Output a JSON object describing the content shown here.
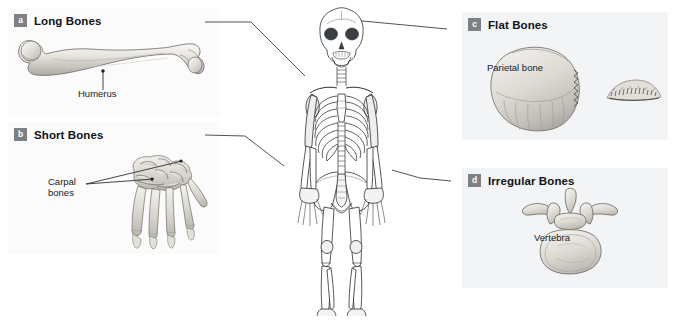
{
  "figure": {
    "background": "#ffffff",
    "badge_color": "#7e8183",
    "badge_text_color": "#ffffff",
    "panel_tint_left": "#fbfbfb",
    "panel_tint_right": "#f2f4f6"
  },
  "panels": [
    {
      "key": "a",
      "badge": "a",
      "title": "Long Bones",
      "illustration": "humerus-bone-drawing",
      "callouts": [
        {
          "text": "Humerus",
          "target": "humerus-shaft"
        }
      ]
    },
    {
      "key": "b",
      "badge": "b",
      "title": "Short Bones",
      "illustration": "hand-carpal-bones-drawing",
      "callouts": [
        {
          "text": "Carpal",
          "target": "carpal-bone-upper"
        },
        {
          "text": "bones",
          "target": "carpal-bone-lower"
        }
      ]
    },
    {
      "key": "c",
      "badge": "c",
      "title": "Flat Bones",
      "illustration": "parietal-bone-drawing",
      "callouts": [
        {
          "text": "Parietal bone",
          "target": "parietal-bone"
        }
      ]
    },
    {
      "key": "d",
      "badge": "d",
      "title": "Irregular Bones",
      "illustration": "vertebra-drawing",
      "callouts": [
        {
          "text": "Vertebra",
          "target": "vertebral-body"
        }
      ]
    }
  ],
  "skeleton": {
    "name": "full-human-skeleton-anterior-view",
    "leader_targets": [
      {
        "panel": "a",
        "region": "left-humerus"
      },
      {
        "panel": "b",
        "region": "left-wrist-carpals"
      },
      {
        "panel": "c",
        "region": "skull-parietal"
      },
      {
        "panel": "d",
        "region": "right-hand"
      }
    ]
  }
}
